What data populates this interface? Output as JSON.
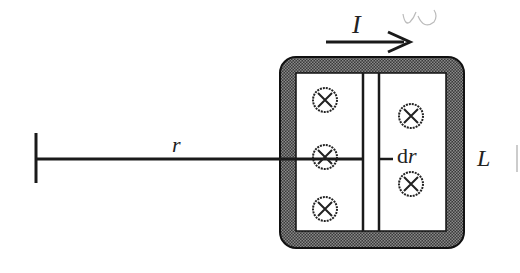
{
  "diagram": {
    "labels": {
      "current": "I",
      "radius": "r",
      "thickness_d": "d",
      "thickness_r": "r",
      "length": "L",
      "scribble": "ω"
    },
    "field_symbols": {
      "left_column_count": 3,
      "right_column_count": 2,
      "symbol": "⊗",
      "meaning": "field into page"
    },
    "colors": {
      "ink": "#1a1a1a",
      "hatch": "#555555",
      "background": "#ffffff",
      "scribble": "#bbbbbb"
    }
  }
}
